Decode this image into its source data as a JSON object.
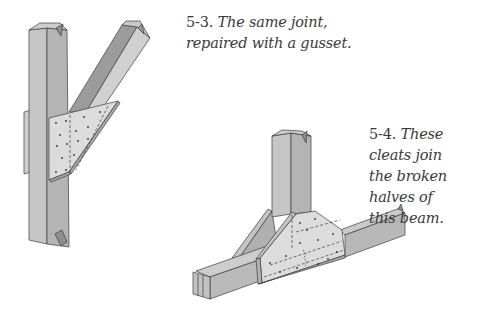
{
  "figures": [
    {
      "id": "5-3",
      "number": "5-3.",
      "caption_lines": [
        "The same joint,",
        "repaired with a gusset."
      ],
      "subject": "post-and-brace joint with triangular gusset plate"
    },
    {
      "id": "5-4",
      "number": "5-4.",
      "caption_lines": [
        "These cleats join",
        "the broken halves of",
        "this beam."
      ],
      "subject": "broken beam under post joined by trapezoidal cleats"
    }
  ],
  "colors": {
    "light_face": "#d4d4d4",
    "mid_face": "#bdbdbd",
    "dark_face": "#9a9a9a",
    "plate": "#dcdcdc",
    "stroke": "#3c3c3c",
    "caption_text": "#3a3a3a"
  }
}
